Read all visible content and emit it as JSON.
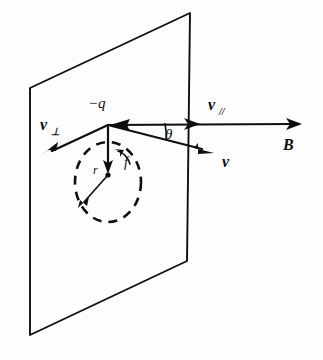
{
  "figure": {
    "caption": "",
    "background_color": "#fdfdfd",
    "ink_color": "#100f0d"
  },
  "labels": {
    "charge": "−q",
    "v_perp": "v",
    "v_perp_sub": "⊥",
    "v_par": "v",
    "v_par_sub": "//",
    "velocity": "v",
    "field": "B",
    "angle": "θ",
    "radius": "r",
    "frequency": "f"
  },
  "geometry": {
    "plane": {
      "name": "field-perpendicular-plane",
      "corners": [
        [
          30,
          88
        ],
        [
          190,
          13
        ],
        [
          187,
          261
        ],
        [
          30,
          335
        ]
      ]
    },
    "origin": [
      108,
      125
    ],
    "field_arrow": {
      "from": [
        108,
        125
      ],
      "to": [
        300,
        124
      ]
    },
    "v_parallel_arrow": {
      "from": [
        108,
        125
      ],
      "to": [
        198,
        124
      ]
    },
    "v_perp_arrow": {
      "from": [
        108,
        125
      ],
      "to": [
        42,
        155
      ]
    },
    "v_arrow": {
      "from": [
        108,
        125
      ],
      "to": [
        212,
        152
      ]
    },
    "down_arrow": {
      "from": [
        108,
        127
      ],
      "to": [
        108,
        172
      ]
    },
    "orbit": {
      "center": [
        108,
        182
      ],
      "rx": 33,
      "ry": 40
    },
    "orbit_center_dot": [
      108,
      175
    ],
    "radius_arrow": {
      "from": [
        108,
        175
      ],
      "to": [
        80,
        206
      ]
    },
    "circulation_arc": "counterclockwise"
  }
}
